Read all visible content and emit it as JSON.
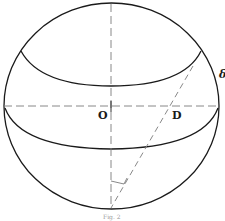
{
  "figure": {
    "labels": {
      "center": "O",
      "point_d": "D",
      "delta": "δ"
    },
    "caption": "Fig. 2",
    "colors": {
      "stroke": "#1a1a1a",
      "dashed": "#7a7a7a",
      "background": "#ffffff"
    }
  }
}
